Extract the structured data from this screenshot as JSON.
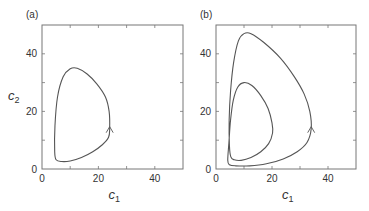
{
  "chart_data": [
    {
      "type": "line",
      "panel_label": "(a)",
      "title": "",
      "xlabel": "c1",
      "ylabel": "c2",
      "xlim": [
        0,
        50
      ],
      "ylim": [
        0,
        50
      ],
      "xticks": [
        0,
        20,
        40
      ],
      "yticks": [
        0,
        20,
        40
      ],
      "minor_ticks": [
        10,
        30,
        50
      ],
      "grid": false,
      "legend": null,
      "series": [
        {
          "name": "limit cycle",
          "closed": true,
          "arrow_at": [
            24,
            14
          ],
          "arrow_direction": "up",
          "points": [
            [
              24,
              14
            ],
            [
              23.8,
              20
            ],
            [
              22.5,
              25
            ],
            [
              19.5,
              29.5
            ],
            [
              16,
              33
            ],
            [
              12.5,
              35
            ],
            [
              10,
              34.8
            ],
            [
              7.5,
              32
            ],
            [
              5.5,
              25
            ],
            [
              4.6,
              15
            ],
            [
              4.5,
              6
            ],
            [
              5,
              3.2
            ],
            [
              7,
              2.6
            ],
            [
              10,
              2.8
            ],
            [
              14,
              4
            ],
            [
              18,
              6
            ],
            [
              21.5,
              8.5
            ],
            [
              23.6,
              11
            ],
            [
              24,
              14
            ]
          ]
        }
      ]
    },
    {
      "type": "line",
      "panel_label": "(b)",
      "title": "",
      "xlabel": "c1",
      "ylabel": "",
      "xlim": [
        0,
        50
      ],
      "ylim": [
        0,
        50
      ],
      "xticks": [
        0,
        20,
        40
      ],
      "yticks": [
        0,
        20,
        40
      ],
      "minor_ticks": [
        10,
        30,
        50
      ],
      "grid": false,
      "legend": null,
      "series": [
        {
          "name": "period-2 orbit",
          "closed": true,
          "arrow_at": [
            34,
            14
          ],
          "arrow_direction": "up",
          "points": [
            [
              34,
              14
            ],
            [
              33.5,
              20
            ],
            [
              31.5,
              26
            ],
            [
              28,
              32
            ],
            [
              23,
              38.5
            ],
            [
              17,
              44
            ],
            [
              12.5,
              47
            ],
            [
              10,
              47
            ],
            [
              8,
              44.5
            ],
            [
              6.3,
              37
            ],
            [
              5.2,
              27
            ],
            [
              4.7,
              17
            ],
            [
              4.8,
              8
            ],
            [
              5.3,
              4.2
            ],
            [
              6.5,
              3.2
            ],
            [
              9,
              3
            ],
            [
              12.5,
              4
            ],
            [
              16,
              6
            ],
            [
              18.8,
              8.8
            ],
            [
              20.2,
              12.5
            ],
            [
              20,
              16
            ],
            [
              18.6,
              21
            ],
            [
              16,
              25.5
            ],
            [
              12.8,
              29
            ],
            [
              10,
              30
            ],
            [
              7.8,
              28.5
            ],
            [
              6.2,
              24
            ],
            [
              5.2,
              17
            ],
            [
              4.6,
              9
            ],
            [
              4.2,
              3
            ],
            [
              4.8,
              1.5
            ],
            [
              7,
              1.1
            ],
            [
              12,
              1.1
            ],
            [
              18,
              1.8
            ],
            [
              24,
              3.5
            ],
            [
              29,
              6
            ],
            [
              32.5,
              9.2
            ],
            [
              34,
              14
            ]
          ]
        }
      ]
    }
  ]
}
